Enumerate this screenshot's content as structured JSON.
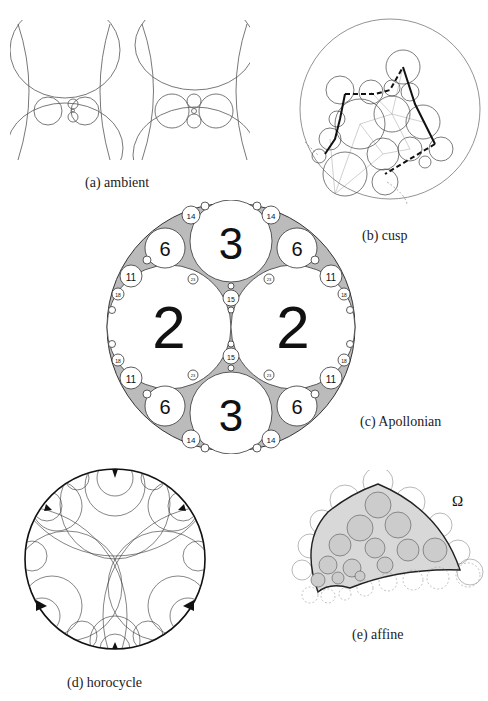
{
  "figure": {
    "panels": [
      {
        "id": "a",
        "caption": "(a) ambient"
      },
      {
        "id": "b",
        "caption": "(b) cusp"
      },
      {
        "id": "c",
        "caption": "(c) Apollonian",
        "labels": {
          "large": [
            "2",
            "2"
          ],
          "medium": [
            "3",
            "3"
          ],
          "six": [
            "6",
            "6",
            "6",
            "6"
          ],
          "eleven": [
            "11",
            "11",
            "11",
            "11"
          ],
          "fourteen": [
            "14",
            "14",
            "14",
            "14"
          ],
          "fifteen": [
            "15",
            "15"
          ],
          "eighteen": [
            "18",
            "18",
            "18",
            "18"
          ],
          "small": [
            "23",
            "26",
            "27"
          ]
        }
      },
      {
        "id": "d",
        "caption": "(d) horocycle"
      },
      {
        "id": "e",
        "caption": "(e) affine",
        "symbol": "Ω"
      }
    ]
  }
}
